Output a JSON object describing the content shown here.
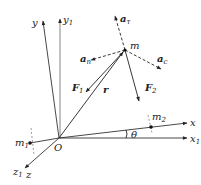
{
  "diagram": {
    "origin": {
      "label": "O"
    },
    "axes": {
      "y": {
        "label": "y"
      },
      "y1": {
        "label": "y",
        "sub": "1"
      },
      "x": {
        "label": "x"
      },
      "x1": {
        "label": "x",
        "sub": "1"
      },
      "z": {
        "label": "z"
      },
      "z1": {
        "label": "z",
        "sub": "1"
      }
    },
    "point_m": {
      "label": "m"
    },
    "point_m1": {
      "label": "m",
      "sub": "1"
    },
    "point_m2": {
      "label": "m",
      "sub": "2"
    },
    "vectors": {
      "r": {
        "label": "r"
      },
      "F1": {
        "label": "F",
        "sub": "1"
      },
      "F2": {
        "label": "F",
        "sub": "2"
      },
      "a_tau": {
        "label": "a",
        "sub": "τ"
      },
      "a_n": {
        "label": "a",
        "sub": "n"
      },
      "a_c": {
        "label": "a",
        "sub": "c"
      }
    },
    "angle": {
      "label": "θ"
    }
  }
}
